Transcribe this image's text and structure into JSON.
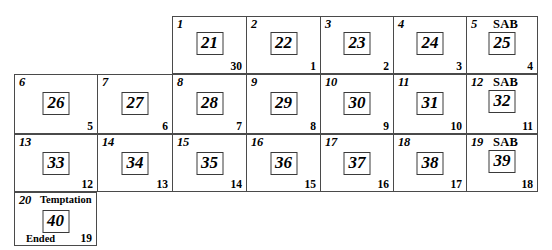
{
  "diagram": {
    "columns": 7,
    "rows": 4,
    "border_color": "#4a4a4a",
    "box_border_color": "#3a3a3a",
    "background_color": "#ffffff",
    "sab_label": "SAB",
    "temptation_label": "Temptation",
    "ended_label": "Ended"
  },
  "rows": [
    {
      "row_index": 1,
      "start_column": 3,
      "cells": [
        {
          "index": "1",
          "value": "21",
          "count": "30",
          "sab": false
        },
        {
          "index": "2",
          "value": "22",
          "count": "1",
          "sab": false
        },
        {
          "index": "3",
          "value": "23",
          "count": "2",
          "sab": false
        },
        {
          "index": "4",
          "value": "24",
          "count": "3",
          "sab": false
        },
        {
          "index": "5",
          "value": "25",
          "count": "4",
          "sab": true
        }
      ]
    },
    {
      "row_index": 2,
      "start_column": 1,
      "cells": [
        {
          "index": "6",
          "value": "26",
          "count": "5",
          "sab": false
        },
        {
          "index": "7",
          "value": "27",
          "count": "6",
          "sab": false
        },
        {
          "index": "8",
          "value": "28",
          "count": "7",
          "sab": false
        },
        {
          "index": "9",
          "value": "29",
          "count": "8",
          "sab": false
        },
        {
          "index": "10",
          "value": "30",
          "count": "9",
          "sab": false
        },
        {
          "index": "11",
          "value": "31",
          "count": "10",
          "sab": false
        },
        {
          "index": "12",
          "value": "32",
          "count": "11",
          "sab": true
        }
      ]
    },
    {
      "row_index": 3,
      "start_column": 1,
      "cells": [
        {
          "index": "13",
          "value": "33",
          "count": "12",
          "sab": false
        },
        {
          "index": "14",
          "value": "34",
          "count": "13",
          "sab": false
        },
        {
          "index": "15",
          "value": "35",
          "count": "14",
          "sab": false
        },
        {
          "index": "16",
          "value": "36",
          "count": "15",
          "sab": false
        },
        {
          "index": "17",
          "value": "37",
          "count": "16",
          "sab": false
        },
        {
          "index": "18",
          "value": "38",
          "count": "17",
          "sab": false
        },
        {
          "index": "19",
          "value": "39",
          "count": "18",
          "sab": true
        }
      ]
    },
    {
      "row_index": 4,
      "start_column": 1,
      "cells": [
        {
          "index": "20",
          "value": "40",
          "count": "19",
          "sab": false,
          "header": "Temptation",
          "footer": "Ended"
        }
      ]
    }
  ]
}
